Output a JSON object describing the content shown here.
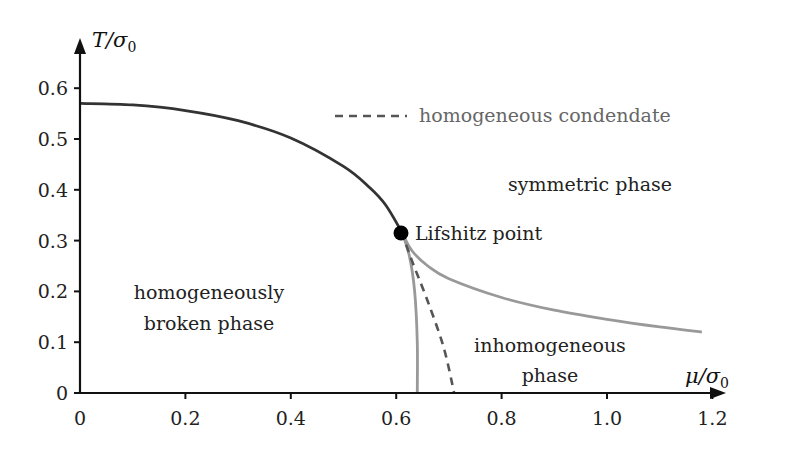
{
  "chart_data": {
    "type": "line",
    "title": "",
    "xlabel": "μ/σ0",
    "ylabel": "T/σ0",
    "xlim": [
      0,
      1.25
    ],
    "ylim": [
      0,
      0.66
    ],
    "grid": false,
    "x_ticks": [
      "0",
      "0.2",
      "0.4",
      "0.6",
      "0.8",
      "1.0",
      "1.2"
    ],
    "y_ticks": [
      "0",
      "0.1",
      "0.2",
      "0.3",
      "0.4",
      "0.5",
      "0.6"
    ],
    "legend": {
      "position": "upper-center",
      "entries": [
        {
          "label": "homogeneous condendate",
          "style": "dashed",
          "color": "#555555"
        }
      ]
    },
    "series": [
      {
        "name": "symmetric/homogeneously-broken boundary",
        "style": "solid",
        "color": "#333333",
        "points": [
          [
            0,
            0.57
          ],
          [
            0.1,
            0.567
          ],
          [
            0.2,
            0.556
          ],
          [
            0.3,
            0.536
          ],
          [
            0.4,
            0.502
          ],
          [
            0.5,
            0.446
          ],
          [
            0.55,
            0.404
          ],
          [
            0.58,
            0.37
          ],
          [
            0.61,
            0.318
          ]
        ]
      },
      {
        "name": "inhomogeneous/symmetric boundary",
        "style": "solid",
        "color": "#999999",
        "points": [
          [
            0.61,
            0.318
          ],
          [
            0.63,
            0.28
          ],
          [
            0.66,
            0.25
          ],
          [
            0.7,
            0.225
          ],
          [
            0.8,
            0.188
          ],
          [
            0.9,
            0.163
          ],
          [
            1.0,
            0.145
          ],
          [
            1.1,
            0.13
          ],
          [
            1.18,
            0.12
          ]
        ]
      },
      {
        "name": "inhomogeneous/homogeneously-broken boundary",
        "style": "solid",
        "color": "#999999",
        "points": [
          [
            0.61,
            0.318
          ],
          [
            0.625,
            0.27
          ],
          [
            0.635,
            0.2
          ],
          [
            0.64,
            0.1
          ],
          [
            0.64,
            0
          ]
        ]
      },
      {
        "name": "homogeneous condendate",
        "style": "dashed",
        "color": "#555555",
        "points": [
          [
            0.61,
            0.318
          ],
          [
            0.63,
            0.26
          ],
          [
            0.66,
            0.18
          ],
          [
            0.69,
            0.09
          ],
          [
            0.71,
            0
          ]
        ]
      }
    ],
    "annotations": [
      {
        "label": "Lifshitz point",
        "x": 0.61,
        "y": 0.318,
        "marker": "filled-circle"
      },
      {
        "label": "symmetric phase",
        "x": 0.91,
        "y": 0.41
      },
      {
        "label": "homogeneously broken phase",
        "x": 0.3,
        "y": 0.17
      },
      {
        "label": "inhomogeneous phase",
        "x": 0.87,
        "y": 0.1
      }
    ]
  },
  "axes": {
    "xlabel_main": "μ/σ",
    "xlabel_sub": "0",
    "ylabel_main": "T/σ",
    "ylabel_sub": "0"
  },
  "labels": {
    "legend": "homogeneous condendate",
    "lifshitz": "Lifshitz point",
    "symmetric": "symmetric phase",
    "broken_line1": "homogeneously",
    "broken_line2": "broken phase",
    "inhom_line1": "inhomogeneous",
    "inhom_line2": "phase"
  }
}
